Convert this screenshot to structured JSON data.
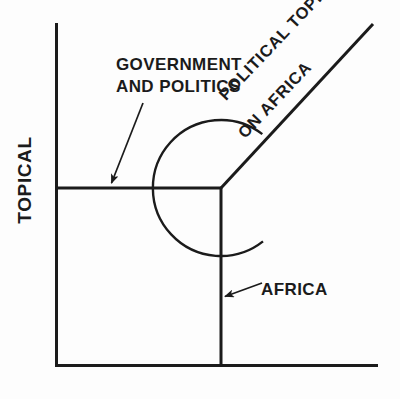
{
  "figure": {
    "title": "",
    "background_color": "#fdfdfd",
    "line_color": "#1b1b1b",
    "axes": {
      "y_axis_label": "TOPICAL",
      "x_axis_label": "",
      "x_axis": {
        "x1": 56,
        "y1": 365,
        "x2": 378,
        "y2": 365
      },
      "y_axis": {
        "x1": 56,
        "y1": 23,
        "x2": 56,
        "y2": 365
      }
    },
    "annotations": {
      "government_and_politics": {
        "line1": "GOVERNMENT",
        "line2": "AND POLITICS",
        "arrow": {
          "from_x": 142,
          "from_y": 104,
          "to_x": 110,
          "to_y": 186
        }
      },
      "africa": {
        "label": "AFRICA",
        "arrow": {
          "from_x": 261,
          "from_y": 283,
          "to_x": 224,
          "to_y": 297
        }
      },
      "political_topic_on_africa": {
        "line1": "POLITICAL TOPIC",
        "line2": "ON AFRICA",
        "rotation_deg": -46.5,
        "ray": {
          "from_x": 221,
          "from_y": 188,
          "to_x": 373,
          "to_y": 24
        }
      }
    },
    "shapes": {
      "corner_point": {
        "x": 221,
        "y": 188
      },
      "horizontal_segment": {
        "x1": 56,
        "y1": 188,
        "x2": 221,
        "y2": 188
      },
      "vertical_segment": {
        "x1": 221,
        "y1": 188,
        "x2": 221,
        "y2": 365
      },
      "circle": {
        "cx": 221,
        "cy": 188,
        "r": 68,
        "gap_start_deg": -52,
        "gap_end_deg": -38
      }
    }
  }
}
